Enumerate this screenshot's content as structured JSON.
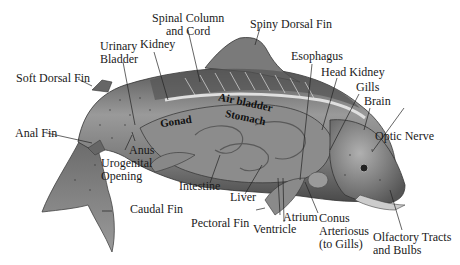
{
  "diagram": {
    "colors": {
      "background": "#ffffff",
      "text": "#1a1a1a",
      "body_dark": "#4a4a4a",
      "body_mid": "#7a7a7a",
      "body_light": "#b8b8b8",
      "organ": "#8c8c8c"
    },
    "labels": {
      "spinal_column": "Spinal Column\nand Cord",
      "spinal_column_l1": "Spinal Column",
      "spinal_column_l2": "and Cord",
      "spiny_dorsal_fin": "Spiny Dorsal Fin",
      "urinary_bladder_l1": "Urinary",
      "urinary_bladder_l2": "Bladder",
      "kidney": "Kidney",
      "esophagus": "Esophagus",
      "head_kidney": "Head Kidney",
      "gills": "Gills",
      "brain": "Brain",
      "soft_dorsal_fin": "Soft Dorsal Fin",
      "air_bladder": "Air bladder",
      "stomach": "Stomach",
      "gonad": "Gonad",
      "optic_nerve": "Optic Nerve",
      "anal_fin": "Anal Fin",
      "anus": "Anus",
      "urogenital_l1": "Urogenital",
      "urogenital_l2": "Opening",
      "intestine": "Intestine",
      "liver": "Liver",
      "caudal_fin": "Caudal Fin",
      "pectoral_fin": "Pectoral Fin",
      "atrium": "Atrium",
      "conus_l1": "Conus",
      "conus_l2": "Arteriosus",
      "conus_l3": "(to Gills)",
      "ventricle": "Ventricle",
      "olfactory_l1": "Olfactory Tracts",
      "olfactory_l2": "and Bulbs"
    }
  }
}
